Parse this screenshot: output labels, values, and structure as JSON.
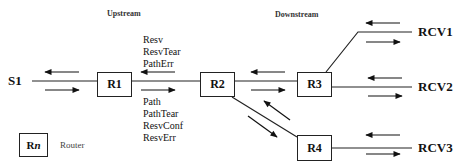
{
  "sections": {
    "upstream": "Upstream",
    "downstream": "Downstream"
  },
  "source": {
    "label": "S1"
  },
  "routers": [
    {
      "id": "R1",
      "label": "R1"
    },
    {
      "id": "R2",
      "label": "R2"
    },
    {
      "id": "R3",
      "label": "R3"
    },
    {
      "id": "R4",
      "label": "R4"
    }
  ],
  "receivers": [
    {
      "label": "RCV1"
    },
    {
      "label": "RCV2"
    },
    {
      "label": "RCV3"
    }
  ],
  "upstream_messages": [
    "Resv",
    "ResvTear",
    "PathErr"
  ],
  "downstream_messages": [
    "Path",
    "PathTear",
    "ResvConf",
    "ResvErr"
  ],
  "legend": {
    "symbol": "Rn",
    "symbol_prefix": "R",
    "symbol_suffix": "n",
    "description": "Router"
  },
  "colors": {
    "line": "#222222",
    "text": "#111111",
    "background": "#ffffff"
  }
}
